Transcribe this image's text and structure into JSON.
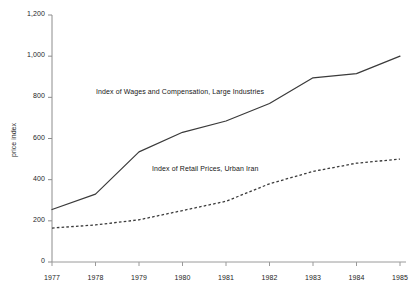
{
  "chart_data": {
    "type": "line",
    "title": "",
    "subtitle": "",
    "xlabel": "",
    "ylabel": "price index",
    "categories": [
      "1977",
      "1978",
      "1979",
      "1980",
      "1981",
      "1982",
      "1983",
      "1984",
      "1985"
    ],
    "x": [
      1977,
      1978,
      1979,
      1980,
      1981,
      1982,
      1983,
      1984,
      1985
    ],
    "xlim": [
      1977,
      1985
    ],
    "ylim": [
      0,
      1200
    ],
    "yticks": [
      0,
      200,
      400,
      600,
      800,
      1000,
      1200
    ],
    "ytick_labels": [
      "0",
      "200",
      "400",
      "600",
      "800",
      "1,000",
      "1,200"
    ],
    "xtick_labels": [
      "1977",
      "1978",
      "1979",
      "1980",
      "1981",
      "1982",
      "1983",
      "1984",
      "1985"
    ],
    "grid": false,
    "legend": "inline-annotations",
    "legend_position": "inside-plot",
    "series": [
      {
        "name": "Index of Wages and Compensation, Large Industries",
        "style": "solid",
        "color": "#3a3a3a",
        "values": [
          255,
          330,
          535,
          630,
          685,
          770,
          895,
          915,
          1000
        ]
      },
      {
        "name": "Index of Retail Prices, Urban Iran",
        "style": "dashed",
        "color": "#3a3a3a",
        "values": [
          165,
          180,
          205,
          250,
          295,
          380,
          440,
          480,
          500
        ]
      }
    ],
    "annotations": [
      {
        "text": "Index of Wages and Compensation, Large Industries",
        "x_px": 96,
        "y_px": 88
      },
      {
        "text": "Index of Retail Prices, Urban Iran",
        "x_px": 152,
        "y_px": 165
      }
    ],
    "axis_color": "#8c8c8c",
    "background": "#ffffff"
  }
}
